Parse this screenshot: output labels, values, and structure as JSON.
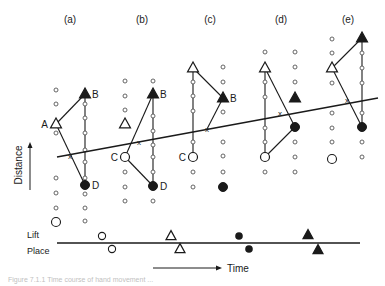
{
  "figure": {
    "width": 385,
    "height": 286,
    "ink_color": "#1a1a1a",
    "panels": [
      {
        "id": "a",
        "label": "(a)",
        "label_pos": [
          70,
          23
        ],
        "dots": [
          [
            56,
            90
          ],
          [
            56,
            104
          ],
          [
            56,
            133
          ],
          [
            56,
            178
          ],
          [
            56,
            193
          ],
          [
            56,
            208
          ],
          [
            85,
            104
          ],
          [
            85,
            118
          ],
          [
            85,
            133
          ],
          [
            85,
            150
          ],
          [
            85,
            162
          ],
          [
            85,
            178
          ],
          [
            85,
            194
          ],
          [
            85,
            208
          ],
          [
            85,
            221
          ]
        ],
        "big_circles": [
          [
            56,
            222
          ]
        ],
        "open_triangles": [
          {
            "x": 56,
            "y": 124,
            "label": "A",
            "label_side": "left"
          }
        ],
        "filled_triangles": [
          {
            "x": 85,
            "y": 94,
            "label": "B",
            "label_side": "right"
          }
        ],
        "open_circle_labeled": [],
        "filled_circles": [
          {
            "x": 85,
            "y": 185,
            "label": "D",
            "label_side": "right"
          }
        ],
        "lines": [
          [
            56,
            124,
            85,
            94
          ],
          [
            56,
            124,
            85,
            185
          ],
          [
            85,
            94,
            85,
            185
          ]
        ],
        "cross": [
          70,
          156
        ]
      },
      {
        "id": "b",
        "label": "(b)",
        "label_pos": [
          142,
          23
        ],
        "dots": [
          [
            125,
            81
          ],
          [
            125,
            96
          ],
          [
            125,
            110
          ],
          [
            125,
            172
          ],
          [
            125,
            187
          ],
          [
            125,
            201
          ],
          [
            153,
            81
          ],
          [
            153,
            116
          ],
          [
            153,
            131
          ],
          [
            153,
            145
          ],
          [
            153,
            157
          ],
          [
            153,
            172
          ],
          [
            153,
            201
          ]
        ],
        "big_circles": [],
        "open_triangles": [
          {
            "x": 125,
            "y": 124,
            "label": "",
            "label_side": "left"
          }
        ],
        "filled_triangles": [
          {
            "x": 153,
            "y": 94,
            "label": "B",
            "label_side": "right"
          }
        ],
        "open_circle_labeled": [
          {
            "x": 125,
            "y": 157,
            "label": "C",
            "label_side": "left"
          }
        ],
        "filled_circles": [
          {
            "x": 153,
            "y": 186,
            "label": "D",
            "label_side": "right"
          }
        ],
        "lines": [
          [
            125,
            157,
            153,
            94
          ],
          [
            125,
            157,
            153,
            186
          ],
          [
            153,
            94,
            153,
            186
          ]
        ],
        "cross": [
          139,
          142
        ]
      },
      {
        "id": "c",
        "label": "(c)",
        "label_pos": [
          210,
          23
        ],
        "dots": [
          [
            193,
            82
          ],
          [
            193,
            96
          ],
          [
            193,
            111
          ],
          [
            193,
            142
          ],
          [
            193,
            172
          ],
          [
            193,
            187
          ],
          [
            223,
            67
          ],
          [
            223,
            82
          ],
          [
            223,
            112
          ],
          [
            223,
            142
          ],
          [
            223,
            156
          ],
          [
            223,
            172
          ]
        ],
        "big_circles": [],
        "open_triangles": [
          {
            "x": 193,
            "y": 68,
            "label": "",
            "label_side": "left"
          }
        ],
        "filled_triangles": [
          {
            "x": 223,
            "y": 98,
            "label": "B",
            "label_side": "right"
          }
        ],
        "open_circle_labeled": [
          {
            "x": 193,
            "y": 157,
            "label": "C",
            "label_side": "left"
          }
        ],
        "filled_circles": [
          {
            "x": 223,
            "y": 187,
            "label": "",
            "label_side": "right"
          }
        ],
        "lines": [
          [
            193,
            68,
            223,
            98
          ],
          [
            193,
            68,
            193,
            157
          ],
          [
            223,
            98,
            207,
            129
          ]
        ],
        "cross": [
          207,
          129
        ]
      },
      {
        "id": "d",
        "label": "(d)",
        "label_pos": [
          281,
          23
        ],
        "dots": [
          [
            265,
            52
          ],
          [
            265,
            82
          ],
          [
            265,
            97
          ],
          [
            265,
            128
          ],
          [
            265,
            142
          ],
          [
            265,
            172
          ],
          [
            295,
            52
          ],
          [
            295,
            67
          ],
          [
            295,
            82
          ],
          [
            295,
            142
          ],
          [
            295,
            157
          ],
          [
            295,
            172
          ]
        ],
        "big_circles": [],
        "open_triangles": [
          {
            "x": 265,
            "y": 68,
            "label": "",
            "label_side": "left"
          }
        ],
        "filled_triangles": [
          {
            "x": 295,
            "y": 98,
            "label": "",
            "label_side": "right"
          }
        ],
        "open_circle_labeled": [
          {
            "x": 265,
            "y": 157,
            "label": "",
            "label_side": "left"
          }
        ],
        "filled_circles": [
          {
            "x": 295,
            "y": 127,
            "label": "",
            "label_side": "right"
          }
        ],
        "lines": [
          [
            265,
            68,
            295,
            127
          ],
          [
            265,
            68,
            265,
            157
          ],
          [
            265,
            157,
            295,
            127
          ]
        ],
        "cross": [
          280,
          113
        ]
      },
      {
        "id": "e",
        "label": "(e)",
        "label_pos": [
          348,
          23
        ],
        "dots": [
          [
            332,
            39
          ],
          [
            332,
            53
          ],
          [
            332,
            83
          ],
          [
            332,
            113
          ],
          [
            332,
            128
          ],
          [
            332,
            142
          ],
          [
            332,
            157
          ],
          [
            362,
            53
          ],
          [
            362,
            68
          ],
          [
            362,
            83
          ],
          [
            362,
            113
          ],
          [
            362,
            142
          ],
          [
            362,
            157
          ]
        ],
        "big_circles": [
          [
            332,
            159
          ]
        ],
        "open_triangles": [
          {
            "x": 332,
            "y": 68,
            "label": "",
            "label_side": "left"
          }
        ],
        "filled_triangles": [
          {
            "x": 362,
            "y": 38,
            "label": "",
            "label_side": "right"
          }
        ],
        "open_circle_labeled": [],
        "filled_circles": [
          {
            "x": 362,
            "y": 127,
            "label": "",
            "label_side": "right"
          }
        ],
        "lines": [
          [
            332,
            68,
            362,
            38
          ],
          [
            332,
            68,
            362,
            127
          ],
          [
            362,
            38,
            362,
            127
          ]
        ],
        "cross": [
          347,
          100
        ]
      }
    ],
    "trend_line": [
      57,
      157,
      378,
      98
    ],
    "distance_axis": {
      "label": "Distance",
      "arrow": [
        30,
        190,
        30,
        142
      ],
      "label_pos": [
        22,
        165
      ]
    },
    "timeline": {
      "line": [
        57,
        243,
        360,
        243
      ],
      "lift_label": "Lift",
      "lift_label_pos": [
        27,
        238
      ],
      "place_label": "Place",
      "place_label_pos": [
        27,
        254
      ],
      "lift_markers": [
        {
          "shape": "open-circle",
          "x": 102,
          "y": 236
        },
        {
          "shape": "open-triangle",
          "x": 171,
          "y": 236
        },
        {
          "shape": "filled-circle",
          "x": 239,
          "y": 236
        },
        {
          "shape": "filled-triangle",
          "x": 308,
          "y": 235
        }
      ],
      "place_markers": [
        {
          "shape": "open-circle",
          "x": 112,
          "y": 249
        },
        {
          "shape": "open-triangle",
          "x": 180,
          "y": 249
        },
        {
          "shape": "filled-circle",
          "x": 249,
          "y": 249
        },
        {
          "shape": "filled-triangle",
          "x": 318,
          "y": 250
        }
      ],
      "time_arrow": [
        153,
        268,
        222,
        268
      ],
      "time_label": "Time",
      "time_label_pos": [
        227,
        272
      ]
    },
    "caption_fragment": "Figure 7.1.1  Time course of hand movement ..."
  }
}
